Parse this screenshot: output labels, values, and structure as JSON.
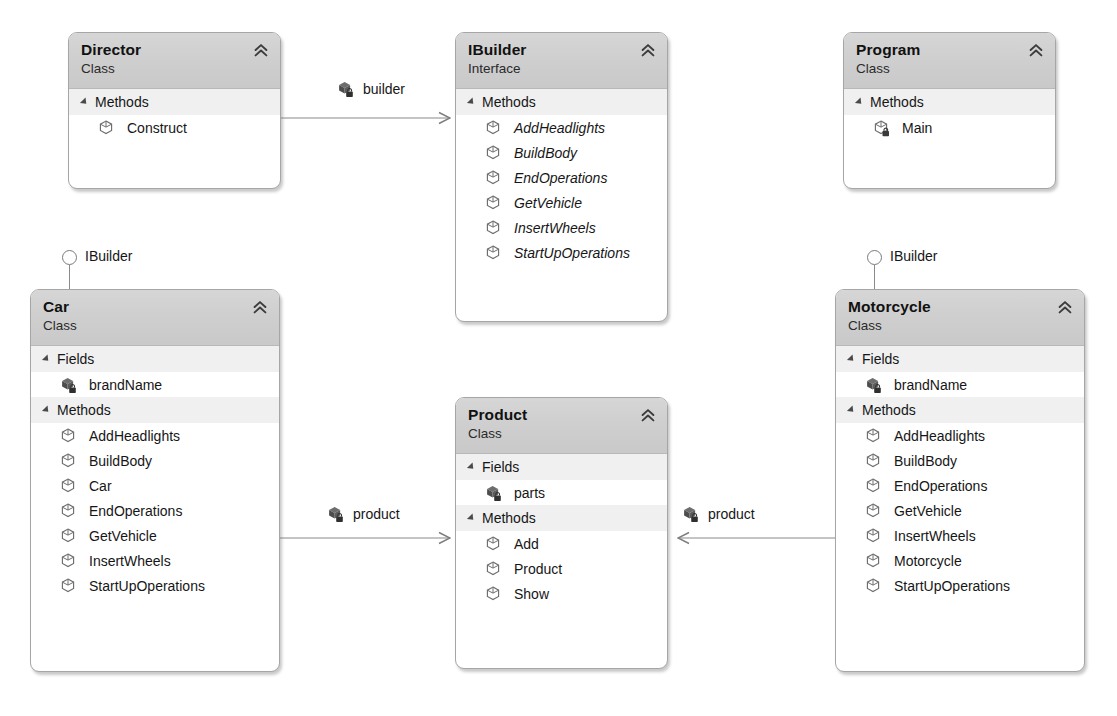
{
  "diagram": {
    "kind": "uml-class-diagram",
    "colors": {
      "header_top": "#d6d6d6",
      "header_bottom": "#c9c9c9",
      "box_border": "#a6a6a6",
      "section_band": "#f0f0f0",
      "edge_line": "#8a8a8a",
      "text": "#161616"
    },
    "labels": {
      "class_stereotype": "Class",
      "interface_stereotype": "Interface",
      "fields_section": "Fields",
      "methods_section": "Methods"
    }
  },
  "boxes": [
    {
      "id": "director",
      "name": "Director",
      "stereotype": "Class",
      "x": 68,
      "y": 32,
      "width": 213,
      "height": 157,
      "sections": [
        {
          "kind": "methods",
          "label": "Methods",
          "members": [
            {
              "name": "Construct",
              "icon": "method-icon",
              "visibility": "public",
              "abstract": false
            }
          ]
        }
      ]
    },
    {
      "id": "ibuilder",
      "name": "IBuilder",
      "stereotype": "Interface",
      "x": 455,
      "y": 32,
      "width": 213,
      "height": 290,
      "sections": [
        {
          "kind": "methods",
          "label": "Methods",
          "members": [
            {
              "name": "AddHeadlights",
              "icon": "method-icon",
              "visibility": "public",
              "abstract": true
            },
            {
              "name": "BuildBody",
              "icon": "method-icon",
              "visibility": "public",
              "abstract": true
            },
            {
              "name": "EndOperations",
              "icon": "method-icon",
              "visibility": "public",
              "abstract": true
            },
            {
              "name": "GetVehicle",
              "icon": "method-icon",
              "visibility": "public",
              "abstract": true
            },
            {
              "name": "InsertWheels",
              "icon": "method-icon",
              "visibility": "public",
              "abstract": true
            },
            {
              "name": "StartUpOperations",
              "icon": "method-icon",
              "visibility": "public",
              "abstract": true
            }
          ]
        }
      ]
    },
    {
      "id": "program",
      "name": "Program",
      "stereotype": "Class",
      "x": 843,
      "y": 32,
      "width": 213,
      "height": 157,
      "sections": [
        {
          "kind": "methods",
          "label": "Methods",
          "members": [
            {
              "name": "Main",
              "icon": "method-private-icon",
              "visibility": "private",
              "abstract": false
            }
          ]
        }
      ]
    },
    {
      "id": "car",
      "name": "Car",
      "stereotype": "Class",
      "x": 30,
      "y": 289,
      "width": 250,
      "height": 383,
      "sections": [
        {
          "kind": "fields",
          "label": "Fields",
          "members": [
            {
              "name": "brandName",
              "icon": "field-private-icon",
              "visibility": "private",
              "abstract": false
            }
          ]
        },
        {
          "kind": "methods",
          "label": "Methods",
          "members": [
            {
              "name": "AddHeadlights",
              "icon": "method-icon",
              "visibility": "public",
              "abstract": false
            },
            {
              "name": "BuildBody",
              "icon": "method-icon",
              "visibility": "public",
              "abstract": false
            },
            {
              "name": "Car",
              "icon": "method-icon",
              "visibility": "public",
              "abstract": false
            },
            {
              "name": "EndOperations",
              "icon": "method-icon",
              "visibility": "public",
              "abstract": false
            },
            {
              "name": "GetVehicle",
              "icon": "method-icon",
              "visibility": "public",
              "abstract": false
            },
            {
              "name": "InsertWheels",
              "icon": "method-icon",
              "visibility": "public",
              "abstract": false
            },
            {
              "name": "StartUpOperations",
              "icon": "method-icon",
              "visibility": "public",
              "abstract": false
            }
          ]
        }
      ]
    },
    {
      "id": "product",
      "name": "Product",
      "stereotype": "Class",
      "x": 455,
      "y": 397,
      "width": 213,
      "height": 272,
      "sections": [
        {
          "kind": "fields",
          "label": "Fields",
          "members": [
            {
              "name": "parts",
              "icon": "field-private-icon",
              "visibility": "private",
              "abstract": false
            }
          ]
        },
        {
          "kind": "methods",
          "label": "Methods",
          "members": [
            {
              "name": "Add",
              "icon": "method-icon",
              "visibility": "public",
              "abstract": false
            },
            {
              "name": "Product",
              "icon": "method-icon",
              "visibility": "public",
              "abstract": false
            },
            {
              "name": "Show",
              "icon": "method-icon",
              "visibility": "public",
              "abstract": false
            }
          ]
        }
      ]
    },
    {
      "id": "motorcycle",
      "name": "Motorcycle",
      "stereotype": "Class",
      "x": 835,
      "y": 289,
      "width": 250,
      "height": 383,
      "sections": [
        {
          "kind": "fields",
          "label": "Fields",
          "members": [
            {
              "name": "brandName",
              "icon": "field-private-icon",
              "visibility": "private",
              "abstract": false
            }
          ]
        },
        {
          "kind": "methods",
          "label": "Methods",
          "members": [
            {
              "name": "AddHeadlights",
              "icon": "method-icon",
              "visibility": "public",
              "abstract": false
            },
            {
              "name": "BuildBody",
              "icon": "method-icon",
              "visibility": "public",
              "abstract": false
            },
            {
              "name": "EndOperations",
              "icon": "method-icon",
              "visibility": "public",
              "abstract": false
            },
            {
              "name": "GetVehicle",
              "icon": "method-icon",
              "visibility": "public",
              "abstract": false
            },
            {
              "name": "InsertWheels",
              "icon": "method-icon",
              "visibility": "public",
              "abstract": false
            },
            {
              "name": "Motorcycle",
              "icon": "method-icon",
              "visibility": "public",
              "abstract": false
            },
            {
              "name": "StartUpOperations",
              "icon": "method-icon",
              "visibility": "public",
              "abstract": false
            }
          ]
        }
      ]
    }
  ],
  "lollipops": [
    {
      "id": "car-ibuilder",
      "label": "IBuilder",
      "x": 57,
      "y": 250,
      "for_box": "car"
    },
    {
      "id": "motorcycle-ibuilder",
      "label": "IBuilder",
      "x": 862,
      "y": 250,
      "for_box": "motorcycle"
    }
  ],
  "associations": [
    {
      "id": "director-builder",
      "label": "builder",
      "icon": "field-private-icon",
      "from": "director",
      "to": "ibuilder",
      "label_x": 336,
      "label_y": 80
    },
    {
      "id": "car-product",
      "label": "product",
      "icon": "field-private-icon",
      "from": "car",
      "to": "product",
      "label_x": 326,
      "label_y": 505
    },
    {
      "id": "motorcycle-product",
      "label": "product",
      "icon": "field-private-icon",
      "from": "motorcycle",
      "to": "product",
      "label_x": 681,
      "label_y": 505
    }
  ]
}
